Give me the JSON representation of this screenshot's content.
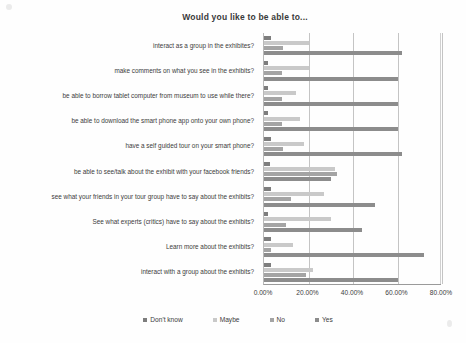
{
  "chart_data": {
    "type": "bar",
    "orientation": "horizontal",
    "title": "Would you like to be able to...",
    "xlabel": "",
    "ylabel": "",
    "xlim": [
      0,
      80
    ],
    "xticks": [
      "0.00%",
      "20.00%",
      "40.00%",
      "60.00%",
      "80.00%"
    ],
    "xtick_values": [
      0,
      20,
      40,
      60,
      80
    ],
    "grid": true,
    "legend_position": "bottom",
    "categories": [
      "interact as a group in the exhibites?",
      "make comments on what you see in the exhibits?",
      "be able to borrow tablet computer from museum to use while there?",
      "be able to download the smart phone app onto your own phone?",
      "have a self guided tour on your smart phone?",
      "be able to see/talk about the exhibit with your facebook friends?",
      "see what your friends in your tour group have to say about the exhibits?",
      "See what experts (critics) have to say about the exhibits?",
      "Learn more about the exhibits?",
      "interact with a group about the exhibits?"
    ],
    "series": [
      {
        "name": "Don't know",
        "color": "#7d7d7d",
        "values": [
          3.0,
          2.0,
          2.0,
          2.0,
          3.0,
          2.5,
          3.0,
          2.0,
          3.0,
          3.0
        ]
      },
      {
        "name": "Maybe",
        "color": "#c9c9c9",
        "values": [
          20.0,
          20.0,
          14.5,
          16.0,
          18.0,
          32.0,
          27.0,
          30.0,
          13.0,
          22.0
        ]
      },
      {
        "name": "No",
        "color": "#a4a4a4",
        "values": [
          8.5,
          8.0,
          8.0,
          8.0,
          8.5,
          33.0,
          12.0,
          10.0,
          3.0,
          19.0
        ]
      },
      {
        "name": "Yes",
        "color": "#8c8c8c",
        "values": [
          62.0,
          60.0,
          60.0,
          60.0,
          62.0,
          30.0,
          50.0,
          44.0,
          72.0,
          60.0
        ]
      }
    ]
  },
  "legend": {
    "items": [
      {
        "label": "Don't know",
        "swatch_class": "sw-dontknow"
      },
      {
        "label": "Maybe",
        "swatch_class": "sw-maybe"
      },
      {
        "label": "No",
        "swatch_class": "sw-no"
      },
      {
        "label": "Yes",
        "swatch_class": "sw-yes"
      }
    ]
  }
}
